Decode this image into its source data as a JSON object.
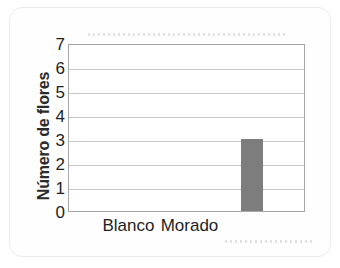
{
  "chart_data": {
    "type": "bar",
    "title": "",
    "xlabel": "",
    "ylabel": "Número de flores",
    "categories": [
      "Blanco",
      "Morado"
    ],
    "values": [
      0,
      0
    ],
    "extra_bars": [
      {
        "label": "",
        "value": 3,
        "slot": 3
      }
    ],
    "ylim": [
      0,
      7
    ],
    "yticks": [
      "0",
      "1",
      "2",
      "3",
      "4",
      "5",
      "6",
      "7"
    ],
    "grid": true,
    "legend": "none",
    "bar_color": "#7d7d7d",
    "gridline_color": "#c6c6c8",
    "frame_color": "#a6a6a8",
    "axis_text_color": "#1e1e1e"
  }
}
